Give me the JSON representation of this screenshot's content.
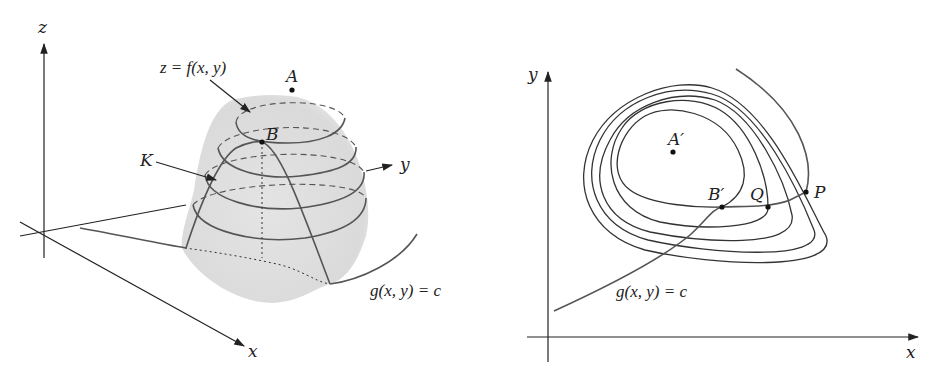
{
  "figure_left": {
    "title": "3D surface with constraint curve",
    "axes": {
      "z": "z",
      "y": "y",
      "x": "x"
    },
    "labels": {
      "surface": "z = f(x, y)",
      "point_a": "A",
      "point_b": "B",
      "curve_k": "K",
      "constraint": "g(x, y) = c"
    }
  },
  "figure_right": {
    "title": "Level curves with constraint",
    "axes": {
      "y": "y",
      "x": "x"
    },
    "labels": {
      "point_a_prime": "A′",
      "point_b_prime": "B′",
      "point_q": "Q",
      "point_p": "P",
      "constraint": "g(x, y) = c"
    },
    "level_curve_count": 5
  },
  "colors": {
    "ink": "#222222",
    "curve": "#555555",
    "surface_fill": "#e6e6e6"
  }
}
